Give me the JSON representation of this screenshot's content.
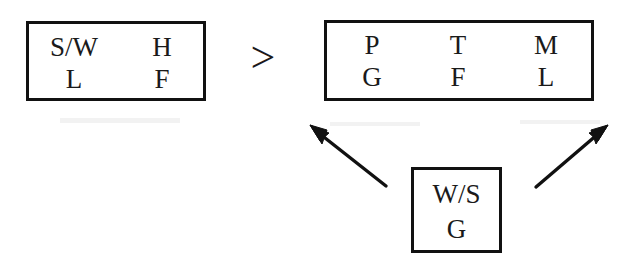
{
  "diagram": {
    "type": "comparison-diagram",
    "background_color": "#ffffff",
    "stroke_color": "#111111",
    "text_color": "#1a1a1a",
    "operator": {
      "symbol": ">",
      "name": "greater-than",
      "meaning": "left group is greater than right group"
    },
    "boxes": [
      {
        "id": "left",
        "name": "left-box",
        "rows": 2,
        "columns": 2,
        "cells": [
          [
            "S/W",
            "H"
          ],
          [
            "L",
            "F"
          ]
        ]
      },
      {
        "id": "right",
        "name": "right-box",
        "rows": 2,
        "columns": 3,
        "cells": [
          [
            "P",
            "T",
            "M"
          ],
          [
            "G",
            "F",
            "L"
          ]
        ]
      },
      {
        "id": "bottom",
        "name": "bottom-box",
        "rows": 2,
        "columns": 1,
        "cells": [
          [
            "W/S"
          ],
          [
            "G"
          ]
        ]
      }
    ],
    "arrows": [
      {
        "id": "arrow-left",
        "name": "arrow-bottom-to-right-box-left",
        "from": [
          386,
          186
        ],
        "to": [
          312,
          127
        ],
        "direction": "up-left",
        "head": "end"
      },
      {
        "id": "arrow-right",
        "name": "arrow-bottom-to-right-box-right",
        "from": [
          536,
          187
        ],
        "to": [
          606,
          127
        ],
        "direction": "up-right",
        "head": "end"
      }
    ]
  }
}
